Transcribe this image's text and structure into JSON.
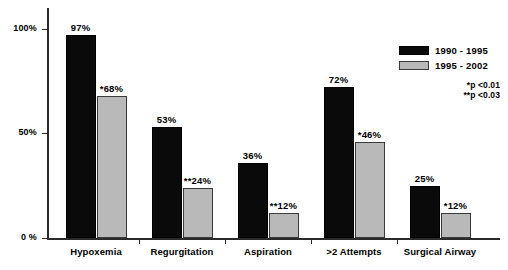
{
  "chart_data": {
    "type": "bar",
    "title": "",
    "xlabel": "",
    "ylabel": "",
    "ylim": [
      0,
      110
    ],
    "grid": false,
    "legend_position": "top-right",
    "categories": [
      "Hypoxemia",
      "Regurgitation",
      "Aspiration",
      ">2 Attempts",
      "Surgical Airway"
    ],
    "ytick_labels": [
      "0 %",
      "50%",
      "100%"
    ],
    "ytick_values": [
      0,
      50,
      100
    ],
    "series": [
      {
        "name": "1990 - 1995",
        "color": "#0a0a0a",
        "values": [
          97,
          53,
          36,
          72,
          25
        ],
        "labels": [
          "97%",
          "53%",
          "36%",
          "72%",
          "25%"
        ]
      },
      {
        "name": "1995 - 2002",
        "color": "#b9b9b9",
        "values": [
          68,
          24,
          12,
          46,
          12
        ],
        "labels": [
          "*68%",
          "**24%",
          "**12%",
          "*46%",
          "*12%"
        ]
      }
    ],
    "annotations": [
      "*p <0.01",
      "**p <0.03"
    ]
  },
  "legend": {
    "items": [
      {
        "label": "1990 - 1995",
        "swatch": "dark"
      },
      {
        "label": "1995 - 2002",
        "swatch": "light"
      }
    ]
  },
  "footnotes": {
    "one_star": "*p <0.01",
    "two_star": "**p <0.03"
  }
}
